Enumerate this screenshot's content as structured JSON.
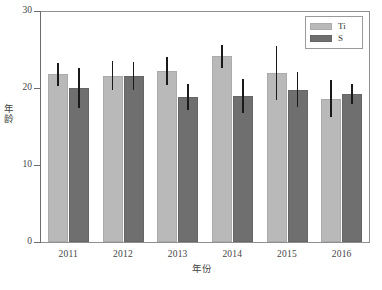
{
  "chart_data": {
    "type": "bar",
    "title": "",
    "xlabel": "年份",
    "ylabel": "年龄",
    "categories": [
      "2011",
      "2012",
      "2013",
      "2014",
      "2015",
      "2016"
    ],
    "ylim": [
      0,
      30
    ],
    "yticks": [
      0,
      10,
      20,
      30
    ],
    "ytick_labels": [
      "0",
      "10",
      "20",
      "30"
    ],
    "grid": false,
    "legend_position": "top-right",
    "series": [
      {
        "name": "Ti",
        "color": "#b9b9b9",
        "values": [
          21.8,
          21.6,
          22.2,
          24.1,
          22.0,
          18.6
        ],
        "errors": [
          1.5,
          1.9,
          1.8,
          1.5,
          3.5,
          2.4
        ]
      },
      {
        "name": "S",
        "color": "#6f6f6f",
        "values": [
          20.0,
          21.6,
          18.8,
          19.0,
          19.8,
          19.2
        ],
        "errors": [
          2.6,
          1.8,
          1.7,
          2.2,
          2.3,
          1.3
        ]
      }
    ]
  },
  "legend": {
    "items": [
      {
        "label": "Ti",
        "color": "#b9b9b9"
      },
      {
        "label": "S",
        "color": "#6f6f6f"
      }
    ]
  },
  "axes": {
    "y_title": "年龄",
    "x_title": "年份"
  }
}
